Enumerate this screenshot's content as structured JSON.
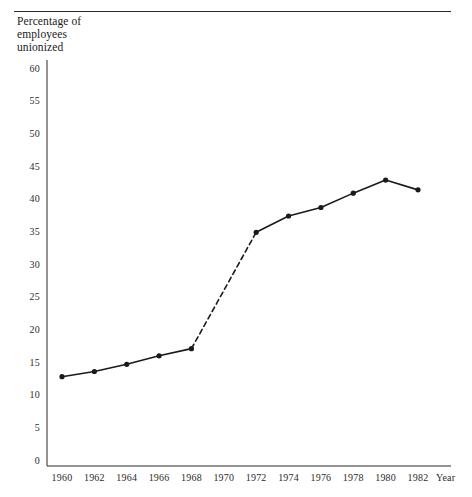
{
  "figure": {
    "axis_title": "Percentage of\nemployees\nunionized",
    "x_axis_name": "Year",
    "line_color": "#1a1a1a",
    "rule_color": "#2b2b2b"
  },
  "chart_data": {
    "type": "line",
    "title": "",
    "subtitle": "",
    "xlabel": "Year",
    "ylabel": "Percentage of employees unionized",
    "xlim": [
      1959,
      1983
    ],
    "ylim": [
      0,
      60
    ],
    "ytick_values": [
      0,
      5,
      10,
      15,
      20,
      25,
      30,
      35,
      40,
      45,
      50,
      55,
      60
    ],
    "ytick_labels": [
      "0",
      "5",
      "10",
      "15",
      "20",
      "25",
      "30",
      "35",
      "40",
      "45",
      "50",
      "55",
      "60"
    ],
    "xtick_values": [
      1960,
      1962,
      1964,
      1966,
      1968,
      1970,
      1972,
      1974,
      1976,
      1978,
      1980,
      1982
    ],
    "xtick_labels": [
      "1960",
      "1962",
      "1964",
      "1966",
      "1968",
      "1970",
      "1972",
      "1974",
      "1976",
      "1978",
      "1980",
      "1982"
    ],
    "grid": false,
    "legend": "none",
    "markers": "filled-circle",
    "x": [
      1960,
      1962,
      1964,
      1966,
      1968,
      1972,
      1974,
      1976,
      1978,
      1980,
      1982
    ],
    "values": [
      12.9,
      13.7,
      14.8,
      16.1,
      17.2,
      35.0,
      37.5,
      38.8,
      41.0,
      43.0,
      41.5
    ],
    "series": [
      {
        "name": "Percentage of employees unionized",
        "x": [
          1960,
          1962,
          1964,
          1966,
          1968,
          1972,
          1974,
          1976,
          1978,
          1980,
          1982
        ],
        "values": [
          12.9,
          13.7,
          14.8,
          16.1,
          17.2,
          35.0,
          37.5,
          38.8,
          41.0,
          43.0,
          41.5
        ]
      }
    ],
    "dashed_segments": [
      {
        "from_x": 1968,
        "to_x": 1972,
        "note": "no data point at 1970"
      }
    ],
    "annotations": []
  }
}
